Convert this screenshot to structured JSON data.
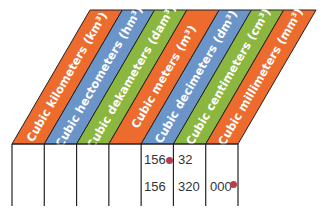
{
  "diagram": {
    "units": [
      {
        "label": "Cubic kilometers (km³)",
        "color": "#ec6b2d"
      },
      {
        "label": "Cubic hectometers (hm³)",
        "color": "#6b95c9"
      },
      {
        "label": "Cubic dekameters (dam³)",
        "color": "#8bb640"
      },
      {
        "label": "Cubic meters (m³)",
        "color": "#ec6b2d"
      },
      {
        "label": "Cubic decimeters (dm³)",
        "color": "#6b95c9"
      },
      {
        "label": "Cubic centimeters (cm³)",
        "color": "#8bb640"
      },
      {
        "label": "Cubic millimeters (mm³)",
        "color": "#ec6b2d"
      }
    ],
    "rows": [
      {
        "cells": [
          {
            "text": "156",
            "x": 144,
            "y": 153
          },
          {
            "text": "32",
            "x": 178,
            "y": 153
          }
        ],
        "dot": {
          "x": 169,
          "y": 157
        }
      },
      {
        "cells": [
          {
            "text": "156",
            "x": 144,
            "y": 180
          },
          {
            "text": "320",
            "x": 178,
            "y": 180
          },
          {
            "text": "000",
            "x": 210,
            "y": 180
          }
        ],
        "dot": {
          "x": 233,
          "y": 181
        }
      }
    ],
    "dot_color": "#b5404a"
  }
}
